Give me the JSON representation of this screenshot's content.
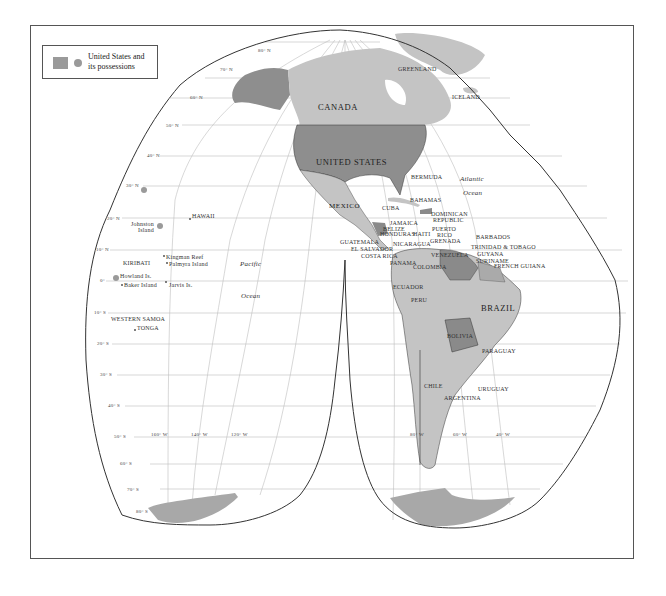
{
  "legend": {
    "label_line1": "United States and",
    "label_line2": "its possessions",
    "fill_color": "#9a9a9a"
  },
  "colors": {
    "us": "#8e8e8e",
    "other_land": "#c4c4c4",
    "dark_land": "#8a8a8a",
    "antarctica": "#a8a8a8",
    "grid": "#bbbbbb",
    "outline": "#333333"
  },
  "countries": {
    "canada": "CANADA",
    "us": "UNITED STATES",
    "greenland": "GREENLAND",
    "iceland": "ICELAND",
    "mexico": "MEXICO",
    "bermuda": "BERMUDA",
    "bahamas": "BAHAMAS",
    "cuba": "CUBA",
    "dominican1": "DOMINICAN",
    "dominican2": "REPUBLIC",
    "jamaica": "JAMAICA",
    "belize": "BELIZE",
    "honduras": "HONDURAS",
    "haiti": "HAITI",
    "puerto1": "PUERTO",
    "puerto2": "RICO",
    "barbados": "BARBADOS",
    "guatemala": "GUATEMALA",
    "nicaragua": "NICARAGUA",
    "grenada": "GRENADA",
    "elsalvador": "EL SALVADOR",
    "trinidad": "TRINIDAD & TOBAGO",
    "costarica": "COSTA RICA",
    "guyana": "GUYANA",
    "suriname": "SURINAME",
    "panama": "PANAMA",
    "venezuela": "VENEZUELA",
    "colombia": "COLOMBIA",
    "frguiana": "FRENCH GUIANA",
    "ecuador": "ECUADOR",
    "peru": "PERU",
    "brazil": "BRAZIL",
    "bolivia": "BOLIVIA",
    "paraguay": "PARAGUAY",
    "chile": "CHILE",
    "argentina": "ARGENTINA",
    "uruguay": "URUGUAY",
    "hawaii": "HAWAII",
    "johnston1": "Johnston",
    "johnston2": "Island",
    "kiribati": "KIRIBATI",
    "kingman": "Kingman Reef",
    "palmyra": "Palmyra Island",
    "howland": "Howland Is.",
    "baker": "Baker Island",
    "jarvis": "Jarvis Is.",
    "wsamoa": "WESTERN SAMOA",
    "tonga": "TONGA"
  },
  "oceans": {
    "atlantic1": "Atlantic",
    "atlantic2": "Ocean",
    "pacific1": "Pacific",
    "pacific2": "Ocean"
  },
  "latitudes": [
    "80° N",
    "70° N",
    "60° N",
    "50° N",
    "40° N",
    "30° N",
    "20° N",
    "10° N",
    "0°",
    "10° S",
    "20° S",
    "30° S",
    "40° S",
    "50° S",
    "60° S",
    "70° S",
    "80° S"
  ],
  "longitudes": [
    "160° W",
    "140° W",
    "120° W",
    "80° W",
    "60° W",
    "40° W"
  ]
}
